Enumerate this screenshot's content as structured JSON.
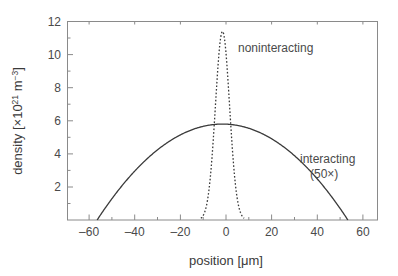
{
  "chart_data": {
    "type": "line",
    "title": "",
    "xlabel": "position [μm]",
    "ylabel": "density [×10²¹ m⁻³]",
    "ylabel_parts": {
      "base": "density [×10",
      "exp1": "21",
      "mid": " m",
      "exp2": "−3",
      "close": "]"
    },
    "xlim": [
      -68,
      68
    ],
    "ylim": [
      0,
      12
    ],
    "xticks": [
      -60,
      -40,
      -20,
      0,
      20,
      40,
      60
    ],
    "xtick_labels": [
      "–60",
      "–40",
      "–20",
      "0",
      "20",
      "40",
      "60"
    ],
    "yticks": [
      2,
      4,
      6,
      8,
      10,
      12
    ],
    "ytick_labels": [
      "2",
      "4",
      "6",
      "8",
      "10",
      "12"
    ],
    "grid": false,
    "legend_position": "inline-annotations",
    "series": [
      {
        "name": "noninteracting",
        "style": "dotted",
        "peak_x": 0,
        "peak_y": 11.4,
        "half_width_um": 3.1,
        "x_extent": [
          -9.5,
          9.5
        ],
        "x": [
          -10,
          -9,
          -8,
          -7,
          -6,
          -5,
          -4,
          -3,
          -2,
          -1,
          0,
          1,
          2,
          3,
          4,
          5,
          6,
          7,
          8,
          9,
          10
        ],
        "values": [
          0.02,
          0.07,
          0.23,
          0.63,
          1.48,
          3.01,
          5.31,
          8.08,
          10.41,
          11.4,
          11.4,
          11.4,
          10.41,
          8.08,
          5.31,
          3.01,
          1.48,
          0.63,
          0.23,
          0.07,
          0.02
        ]
      },
      {
        "name": "interacting (50×)",
        "style": "solid",
        "peak_x": 0,
        "peak_y": 5.8,
        "x_extent": [
          -55,
          55
        ],
        "x": [
          -55,
          -50,
          -45,
          -40,
          -35,
          -30,
          -25,
          -20,
          -15,
          -10,
          -5,
          0,
          5,
          10,
          15,
          20,
          25,
          30,
          35,
          40,
          45,
          50,
          55
        ],
        "values": [
          0.0,
          1.02,
          1.85,
          2.55,
          3.15,
          3.67,
          4.13,
          4.52,
          4.86,
          5.16,
          5.41,
          5.8,
          5.41,
          5.16,
          4.86,
          4.52,
          4.13,
          3.67,
          3.15,
          2.55,
          1.85,
          1.02,
          0.0
        ]
      }
    ],
    "annotations": [
      {
        "text": "noninteracting",
        "x_um": 17,
        "y_val": 10.2
      },
      {
        "text": "interacting",
        "x_um": 42,
        "y_val": 4.5
      },
      {
        "text": "(50×)",
        "x_um": 42,
        "y_val": 3.7
      }
    ]
  },
  "colors": {
    "background": "#ffffff",
    "curve": "#3a3a3a",
    "axis": "#8a8a8a",
    "text": "#4a4a4a"
  }
}
